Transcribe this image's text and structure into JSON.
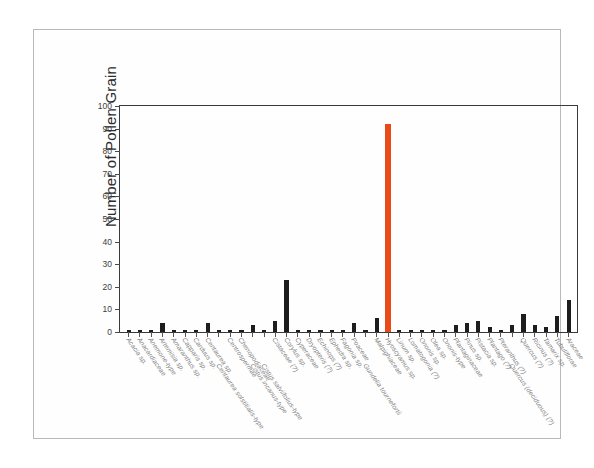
{
  "figure": {
    "ylabel": "Number of Pollen Grain",
    "highlight_color": "#ea4a18",
    "bar_color": "#1d1d1d"
  },
  "chart_data": {
    "type": "bar",
    "title": "",
    "xlabel": "",
    "ylabel": "Number of Pollen Grain",
    "ylim": [
      0,
      100
    ],
    "yticks": [
      0,
      10,
      20,
      30,
      40,
      50,
      60,
      70,
      80,
      90,
      100
    ],
    "grid": false,
    "legend": "none",
    "highlight_category": "Hyoscyamus sp.",
    "categories": [
      "Acacia sp.",
      "Anacardiaceae",
      "Anemone-type",
      "Artemisia sp.",
      "Amaranthus sp.",
      "Capparis sp.",
      "Carduus sp.",
      "Centaurea sp.",
      "Centaurea solstitialis-type",
      "Centrospermae",
      "Chenopodiaceae",
      "Cistus incanus-type",
      "Cistus salviifolius-type",
      "Cistaceae (?)",
      "Corylus sp.",
      "Cyperaceae",
      "Dryopteris (?)",
      "Echinops (?)",
      "Ephedra sp.",
      "Fagonia sp.",
      "Poaceae",
      "Gundelia tournefortii",
      "Malpighiaceae",
      "Hyoscyamus sp.",
      "Linum sp.",
      "Lomatogonia (?)",
      "Ononis sp.",
      "Olea sp.",
      "Ononis-type",
      "Plantaginaceae",
      "Pinus sp.",
      "Pistacia sp.",
      "Plantago (?)",
      "Pteranthus (?)",
      "Quercus (deciduous) (?)",
      "Quercus (?)",
      "Ricinus (?)",
      "Tamarix sp.",
      "Tubuliflorae",
      "Araceae"
    ],
    "values": [
      1,
      1,
      1,
      4,
      1,
      1,
      1,
      4,
      1,
      1,
      1,
      3,
      1,
      5,
      23,
      1,
      1,
      1,
      1,
      1,
      4,
      1,
      6,
      92,
      1,
      1,
      1,
      1,
      1,
      3,
      4,
      5,
      2,
      1,
      3,
      8,
      3,
      2,
      7,
      14
    ]
  }
}
